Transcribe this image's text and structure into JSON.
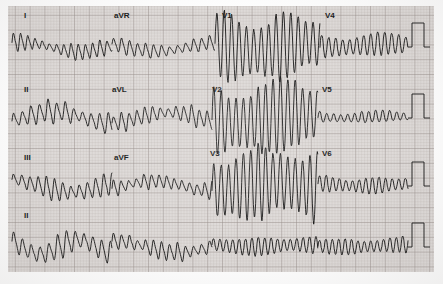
{
  "document": {
    "type": "12-lead-ecg",
    "title": "12-Lead Electrocardiogram",
    "paper": {
      "background_color": "#dedad8",
      "fine_grid_color": "#b9b2ae",
      "bold_grid_color": "#918884",
      "trace_color": "#141414",
      "fine_grid_mm_px": 2.96,
      "bold_grid_px": 14.8,
      "margin_color": "#fdfdfd"
    },
    "layout": {
      "rows": 4,
      "columns": 4,
      "format": "3x4 plus rhythm strip",
      "width_px": 443,
      "height_px": 284
    }
  },
  "labels": [
    {
      "text": "I",
      "x": 24,
      "y": 18,
      "lead": "I"
    },
    {
      "text": "aVR",
      "x": 114,
      "y": 18,
      "lead": "aVR"
    },
    {
      "text": "V1",
      "x": 222,
      "y": 18,
      "lead": "V1"
    },
    {
      "text": "V4",
      "x": 325,
      "y": 18,
      "lead": "V4"
    },
    {
      "text": "II",
      "x": 24,
      "y": 92,
      "lead": "II"
    },
    {
      "text": "aVL",
      "x": 112,
      "y": 92,
      "lead": "aVL"
    },
    {
      "text": "V2",
      "x": 212,
      "y": 92,
      "lead": "V2"
    },
    {
      "text": "V5",
      "x": 322,
      "y": 92,
      "lead": "V5"
    },
    {
      "text": "III",
      "x": 24,
      "y": 160,
      "lead": "III"
    },
    {
      "text": "aVF",
      "x": 114,
      "y": 160,
      "lead": "aVF"
    },
    {
      "text": "V3",
      "x": 210,
      "y": 156,
      "lead": "V3"
    },
    {
      "text": "V6",
      "x": 322,
      "y": 156,
      "lead": "V6"
    },
    {
      "text": "II",
      "x": 24,
      "y": 218,
      "lead": "II-rhythm"
    }
  ],
  "calibration_pulses": [
    {
      "row": 1,
      "x": 412,
      "baseline_y": 47,
      "amplitude_px": 24,
      "width_px": 12
    },
    {
      "row": 2,
      "x": 412,
      "baseline_y": 118,
      "amplitude_px": 24,
      "width_px": 12
    },
    {
      "row": 3,
      "x": 412,
      "baseline_y": 186,
      "amplitude_px": 24,
      "width_px": 12
    },
    {
      "row": 4,
      "x": 412,
      "baseline_y": 247,
      "amplitude_px": 24,
      "width_px": 12
    }
  ],
  "chart_data": {
    "type": "line",
    "xlabel": "time",
    "ylabel": "amplitude (mV)",
    "grid": true,
    "legend_position": "inline-lead-labels",
    "paper_speed": "25 mm/s",
    "gain": "10 mm/mV",
    "rows": [
      {
        "row": 1,
        "baseline_y": 47,
        "x_start": 12,
        "x_end": 408,
        "segments": [
          {
            "lead": "I",
            "x0": 12,
            "x1": 112,
            "rate_px": 7.2,
            "amp": 9,
            "shape": "polymorphic-coarse",
            "seed": 11
          },
          {
            "lead": "aVR",
            "x0": 112,
            "x1": 215,
            "rate_px": 8.0,
            "amp": 8,
            "shape": "polymorphic-coarse",
            "seed": 23
          },
          {
            "lead": "V1",
            "x0": 215,
            "x1": 320,
            "rate_px": 7.4,
            "amp": 36,
            "shape": "vt-wide",
            "seed": 37
          },
          {
            "lead": "V4",
            "x0": 320,
            "x1": 408,
            "rate_px": 7.0,
            "amp": 15,
            "shape": "vt-regular",
            "seed": 41
          }
        ]
      },
      {
        "row": 2,
        "baseline_y": 118,
        "x_start": 12,
        "x_end": 408,
        "segments": [
          {
            "lead": "II",
            "x0": 12,
            "x1": 112,
            "rate_px": 8.6,
            "amp": 12,
            "shape": "polymorphic-drift",
            "seed": 53
          },
          {
            "lead": "aVL",
            "x0": 112,
            "x1": 212,
            "rate_px": 7.8,
            "amp": 10,
            "shape": "polymorphic-coarse",
            "seed": 67
          },
          {
            "lead": "V2",
            "x0": 212,
            "x1": 318,
            "rate_px": 7.4,
            "amp": 40,
            "shape": "vt-wide",
            "seed": 73
          },
          {
            "lead": "V5",
            "x0": 318,
            "x1": 408,
            "rate_px": 7.0,
            "amp": 8,
            "shape": "vt-small",
            "seed": 83
          }
        ]
      },
      {
        "row": 3,
        "baseline_y": 186,
        "x_start": 12,
        "x_end": 408,
        "segments": [
          {
            "lead": "III",
            "x0": 12,
            "x1": 112,
            "rate_px": 8.2,
            "amp": 11,
            "shape": "polymorphic-drift",
            "seed": 97
          },
          {
            "lead": "aVF",
            "x0": 112,
            "x1": 212,
            "rate_px": 7.6,
            "amp": 9,
            "shape": "polymorphic-coarse",
            "seed": 103
          },
          {
            "lead": "V3",
            "x0": 212,
            "x1": 318,
            "rate_px": 7.4,
            "amp": 40,
            "shape": "vt-wide",
            "seed": 109
          },
          {
            "lead": "V6",
            "x0": 318,
            "x1": 408,
            "rate_px": 6.6,
            "amp": 10,
            "shape": "vt-regular",
            "seed": 127
          }
        ]
      },
      {
        "row": 4,
        "baseline_y": 247,
        "x_start": 12,
        "x_end": 408,
        "rhythm_lead": "II",
        "segments": [
          {
            "lead": "II",
            "x0": 12,
            "x1": 112,
            "rate_px": 8.8,
            "amp": 13,
            "shape": "polymorphic-drift",
            "seed": 131
          },
          {
            "lead": "II",
            "x0": 112,
            "x1": 212,
            "rate_px": 8.0,
            "amp": 10,
            "shape": "polymorphic-coarse",
            "seed": 139
          },
          {
            "lead": "II",
            "x0": 212,
            "x1": 318,
            "rate_px": 6.4,
            "amp": 11,
            "shape": "vt-regular",
            "seed": 149
          },
          {
            "lead": "II",
            "x0": 318,
            "x1": 408,
            "rate_px": 6.4,
            "amp": 10,
            "shape": "vt-regular",
            "seed": 151
          }
        ]
      }
    ]
  }
}
